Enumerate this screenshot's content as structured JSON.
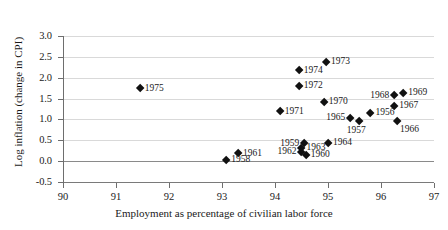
{
  "chart_data": {
    "type": "scatter",
    "title": "",
    "xlabel": "Employment as percentage of civilian labor force",
    "ylabel": "Log inflation (change in CPI)",
    "xlim": [
      90,
      97
    ],
    "ylim": [
      -0.5,
      3.0
    ],
    "xticks": [
      "90",
      "91",
      "92",
      "93",
      "94",
      "95",
      "96",
      "97"
    ],
    "yticks": [
      "3.0",
      "2.5",
      "2.0",
      "1.5",
      "1.0",
      "0.5",
      "0.0",
      "-0.5"
    ],
    "grid": true,
    "legend": "none",
    "marker": "diamond",
    "marker_color": "#111111",
    "points": [
      {
        "label": "1975",
        "x": 91.45,
        "y": 1.74,
        "pos": "lr"
      },
      {
        "label": "1974",
        "x": 94.45,
        "y": 2.17,
        "pos": "lr"
      },
      {
        "label": "1973",
        "x": 94.96,
        "y": 2.38,
        "pos": "lr"
      },
      {
        "label": "1972",
        "x": 94.45,
        "y": 1.8,
        "pos": "lr"
      },
      {
        "label": "1971",
        "x": 94.09,
        "y": 1.19,
        "pos": "lr"
      },
      {
        "label": "1970",
        "x": 94.92,
        "y": 1.42,
        "pos": "lr"
      },
      {
        "label": "1968",
        "x": 96.25,
        "y": 1.57,
        "pos": "ll"
      },
      {
        "label": "1969",
        "x": 96.42,
        "y": 1.63,
        "pos": "lr"
      },
      {
        "label": "1967",
        "x": 96.25,
        "y": 1.32,
        "pos": "lr"
      },
      {
        "label": "1956",
        "x": 95.8,
        "y": 1.15,
        "pos": "lr"
      },
      {
        "label": "1965",
        "x": 95.42,
        "y": 1.03,
        "pos": "ll"
      },
      {
        "label": "1957",
        "x": 95.58,
        "y": 0.96,
        "pos": "lb"
      },
      {
        "label": "1966",
        "x": 96.3,
        "y": 0.96,
        "pos": "lbr"
      },
      {
        "label": "1964",
        "x": 95.0,
        "y": 0.44,
        "pos": "lr"
      },
      {
        "label": "1959",
        "x": 94.55,
        "y": 0.42,
        "pos": "ll"
      },
      {
        "label": "1963",
        "x": 94.5,
        "y": 0.31,
        "pos": "lr"
      },
      {
        "label": "1962",
        "x": 94.5,
        "y": 0.21,
        "pos": "ll"
      },
      {
        "label": "1960",
        "x": 94.58,
        "y": 0.15,
        "pos": "lr"
      },
      {
        "label": "1961",
        "x": 93.3,
        "y": 0.18,
        "pos": "lr"
      },
      {
        "label": "1958",
        "x": 93.08,
        "y": 0.02,
        "pos": "lr"
      }
    ]
  }
}
